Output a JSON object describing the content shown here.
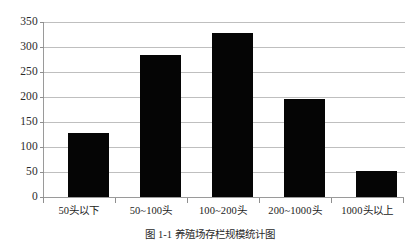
{
  "chart_data": {
    "type": "bar",
    "title": "",
    "subtitle": "",
    "xlabel": "",
    "ylabel": "",
    "categories": [
      "50头以下",
      "50~100头",
      "100~200头",
      "200~1000头",
      "1000头以上"
    ],
    "values": [
      129,
      285,
      328,
      196,
      52
    ],
    "ylim": [
      0,
      350
    ],
    "ytick_step": 50,
    "yticks": [
      "0",
      "50",
      "100",
      "150",
      "200",
      "250",
      "300",
      "350"
    ],
    "ytick_values": [
      0,
      50,
      100,
      150,
      200,
      250,
      300,
      350
    ],
    "grid": true,
    "grid_axis": "y",
    "legend": false,
    "legend_position": "none",
    "bar_color": "#050505",
    "grid_color": "#bfbfbf",
    "axis_color": "#9a9a9a",
    "series": [
      {
        "name": "存栏规模分布",
        "values": [
          129,
          285,
          328,
          196,
          52
        ]
      }
    ]
  },
  "caption": {
    "text": "图 1-1  养殖场存栏规模统计图"
  },
  "axes": {
    "y_axis_name": "y-axis",
    "x_axis_name": "x-axis"
  }
}
